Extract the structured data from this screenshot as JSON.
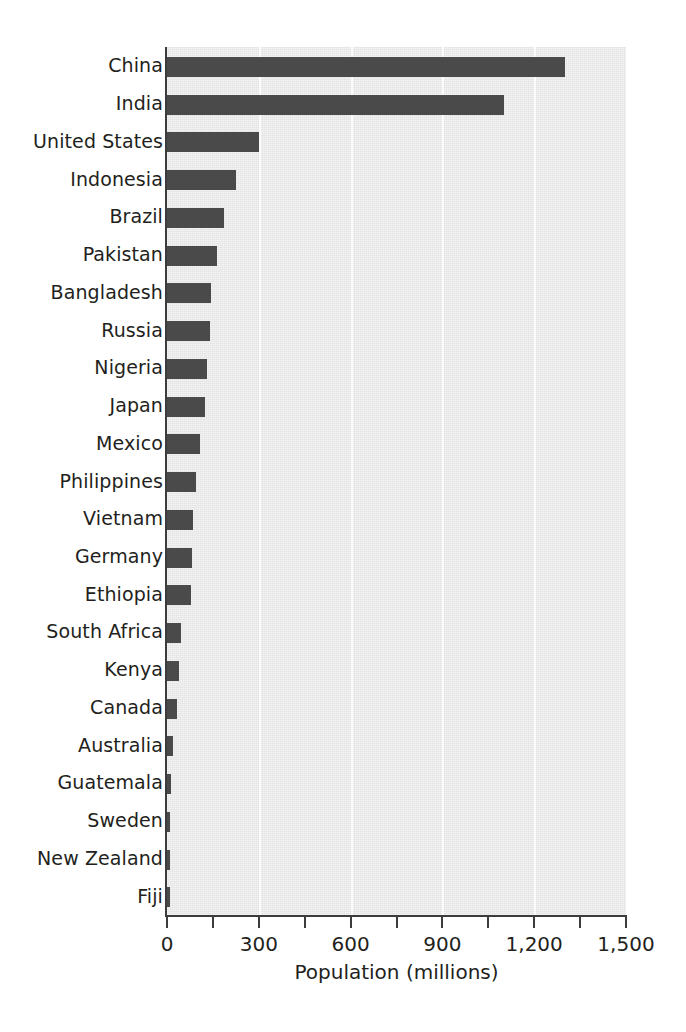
{
  "chart_data": {
    "type": "bar",
    "orientation": "horizontal",
    "title": "",
    "subtitle": "",
    "xlabel": "Population (millions)",
    "ylabel": "",
    "xlim": [
      0,
      1500
    ],
    "ylim": null,
    "grid": "vertical-major-only",
    "legend": null,
    "legend_position": "none",
    "bar_color": "#4a4a4a",
    "plot_background": "#e9e9e9",
    "gridline_color": "#fbfbfb",
    "axis_color": "#3c3c3c",
    "text_color": "#231f20",
    "xticks": [
      0,
      300,
      600,
      900,
      1200,
      1500
    ],
    "xtick_labels": [
      "0",
      "300",
      "600",
      "900",
      "1,200",
      "1,500"
    ],
    "xticks_minor": [
      150,
      450,
      750,
      1050,
      1350
    ],
    "categories": [
      "China",
      "India",
      "United States",
      "Indonesia",
      "Brazil",
      "Pakistan",
      "Bangladesh",
      "Russia",
      "Nigeria",
      "Japan",
      "Mexico",
      "Philippines",
      "Vietnam",
      "Germany",
      "Ethiopia",
      "South Africa",
      "Kenya",
      "Canada",
      "Australia",
      "Guatemala",
      "Sweden",
      "New Zealand",
      "Fiji"
    ],
    "values": [
      1300,
      1100,
      300,
      225,
      185,
      165,
      145,
      140,
      130,
      125,
      107,
      95,
      86,
      82,
      78,
      47,
      38,
      33,
      21,
      14,
      9,
      4,
      1
    ]
  }
}
